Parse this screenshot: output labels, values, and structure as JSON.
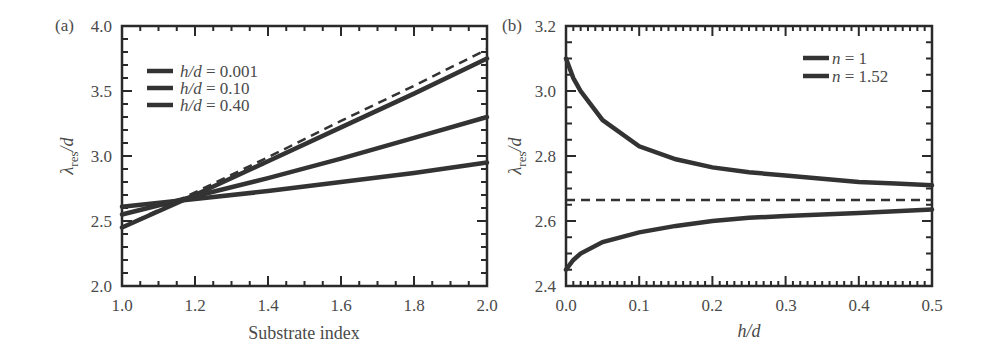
{
  "chart_data": [
    {
      "panel": "(a)",
      "type": "line",
      "title": "",
      "xlabel": "Substrate index",
      "ylabel": "λres/d",
      "xlim": [
        1.0,
        2.0
      ],
      "ylim": [
        2.0,
        4.0
      ],
      "xticks": [
        "1.0",
        "1.2",
        "1.4",
        "1.6",
        "1.8",
        "2.0"
      ],
      "yticks": [
        "2.0",
        "2.5",
        "3.0",
        "3.5",
        "4.0"
      ],
      "grid": false,
      "legend_position": "upper left",
      "x": [
        1.0,
        1.2,
        1.4,
        1.6,
        1.8,
        2.0
      ],
      "series": [
        {
          "name": "h/d = 0.001",
          "style": "solid",
          "values": [
            2.45,
            2.7,
            2.96,
            3.22,
            3.48,
            3.75
          ]
        },
        {
          "name": "h/d = 0.10",
          "style": "solid",
          "values": [
            2.55,
            2.69,
            2.83,
            2.98,
            3.14,
            3.3
          ]
        },
        {
          "name": "h/d = 0.40",
          "style": "solid",
          "values": [
            2.61,
            2.67,
            2.73,
            2.8,
            2.87,
            2.95
          ]
        },
        {
          "name": "limit (dashed)",
          "style": "dashed",
          "values": [
            2.45,
            2.72,
            2.99,
            3.27,
            3.54,
            3.82
          ]
        }
      ]
    },
    {
      "panel": "(b)",
      "type": "line",
      "title": "",
      "xlabel": "h/d",
      "ylabel": "λres/d",
      "xlim": [
        0.0,
        0.5
      ],
      "ylim": [
        2.4,
        3.2
      ],
      "xticks": [
        "0.0",
        "0.1",
        "0.2",
        "0.3",
        "0.4",
        "0.5"
      ],
      "yticks": [
        "2.4",
        "2.6",
        "2.8",
        "3.0",
        "3.2"
      ],
      "grid": false,
      "legend_position": "upper right",
      "x": [
        0.0,
        0.01,
        0.02,
        0.05,
        0.1,
        0.15,
        0.2,
        0.25,
        0.3,
        0.35,
        0.4,
        0.45,
        0.5
      ],
      "series": [
        {
          "name": "n = 1",
          "style": "solid",
          "values": [
            3.1,
            3.04,
            3.0,
            2.91,
            2.83,
            2.79,
            2.765,
            2.75,
            2.74,
            2.73,
            2.72,
            2.715,
            2.71
          ]
        },
        {
          "name": "n = 1.52",
          "style": "solid",
          "values": [
            2.45,
            2.48,
            2.5,
            2.535,
            2.565,
            2.585,
            2.6,
            2.61,
            2.615,
            2.62,
            2.625,
            2.63,
            2.635
          ]
        },
        {
          "name": "asymptote (dashed)",
          "style": "dashed",
          "values": [
            2.665,
            2.665,
            2.665,
            2.665,
            2.665,
            2.665,
            2.665,
            2.665,
            2.665,
            2.665,
            2.665,
            2.665,
            2.665
          ]
        }
      ]
    }
  ],
  "panel_a": {
    "label": "(a)",
    "xlabel": "Substrate index",
    "ylabel_main": "λ",
    "ylabel_sub": "res",
    "ylabel_tail": "/d",
    "xticks": [
      "1.0",
      "1.2",
      "1.4",
      "1.6",
      "1.8",
      "2.0"
    ],
    "yticks": [
      "2.0",
      "2.5",
      "3.0",
      "3.5",
      "4.0"
    ],
    "legend": [
      {
        "var": "h/d",
        "value": " = 0.001"
      },
      {
        "var": "h/d",
        "value": " = 0.10"
      },
      {
        "var": "h/d",
        "value": " = 0.40"
      }
    ]
  },
  "panel_b": {
    "label": "(b)",
    "xlabel": "h/d",
    "ylabel_main": "λ",
    "ylabel_sub": "res",
    "ylabel_tail": "/d",
    "xticks": [
      "0.0",
      "0.1",
      "0.2",
      "0.3",
      "0.4",
      "0.5"
    ],
    "yticks": [
      "2.4",
      "2.6",
      "2.8",
      "3.0",
      "3.2"
    ],
    "legend": [
      {
        "var": "n",
        "value": " = 1"
      },
      {
        "var": "n",
        "value": " = 1.52"
      }
    ]
  },
  "colors": {
    "line": "#333333",
    "axis": "#2a2a2a",
    "text": "#4a4a4a"
  }
}
